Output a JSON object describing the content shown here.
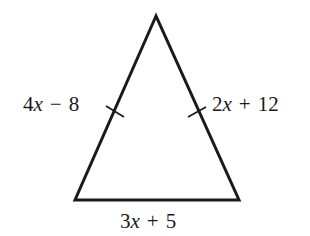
{
  "figure": {
    "type": "isosceles-triangle",
    "stroke_color": "#1a1a1a",
    "vertices": {
      "apex": [
        156,
        16
      ],
      "base_left": [
        75,
        200
      ],
      "base_right": [
        239,
        200
      ]
    },
    "sides": {
      "left": {
        "label": "4x − 8",
        "coefficient": "4",
        "variable": "x",
        "operator": "−",
        "constant": "8",
        "congruence_mark": "single-tick"
      },
      "right": {
        "label": "2x + 12",
        "coefficient": "2",
        "variable": "x",
        "operator": "+",
        "constant": "12",
        "congruence_mark": "single-tick"
      },
      "base": {
        "label": "3x + 5",
        "coefficient": "3",
        "variable": "x",
        "operator": "+",
        "constant": "5"
      }
    }
  }
}
